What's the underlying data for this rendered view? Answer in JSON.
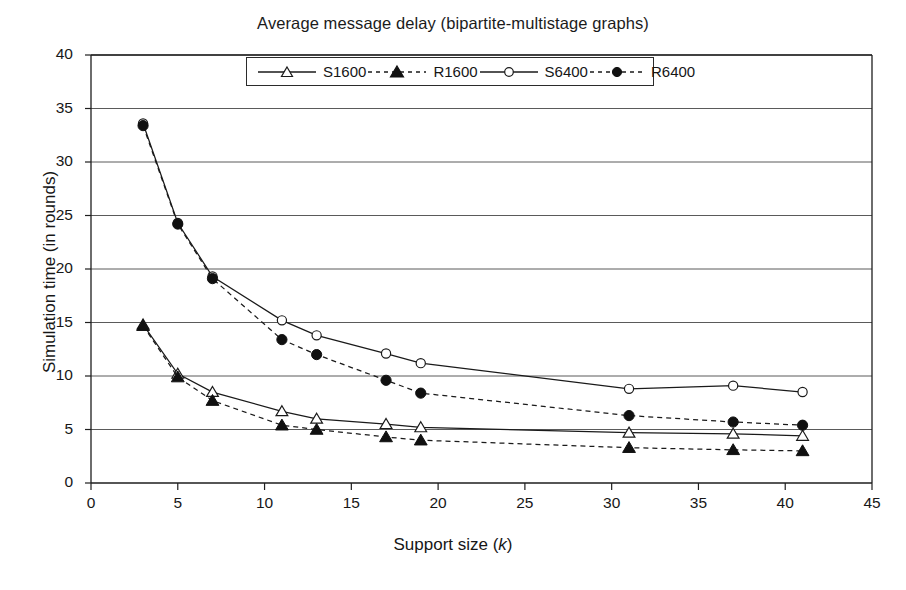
{
  "chart_data": {
    "type": "line",
    "title": "Average message delay (bipartite-multistage graphs)",
    "xlabel": "Support size (k)",
    "ylabel": "Simulation time (in rounds)",
    "xlim": [
      0,
      45
    ],
    "ylim": [
      0,
      40
    ],
    "xticks": [
      0,
      5,
      10,
      15,
      20,
      25,
      30,
      35,
      40,
      45
    ],
    "yticks": [
      0,
      5,
      10,
      15,
      20,
      25,
      30,
      35,
      40
    ],
    "grid": "horizontal",
    "legend_position": "top-center-inside",
    "series": [
      {
        "name": "S1600",
        "marker": "open-triangle",
        "line": "solid",
        "x": [
          3,
          5,
          7,
          11,
          13,
          17,
          19,
          31,
          37,
          41
        ],
        "values": [
          14.8,
          10.2,
          8.5,
          6.7,
          6.0,
          5.5,
          5.2,
          4.7,
          4.6,
          4.4
        ]
      },
      {
        "name": "R1600",
        "marker": "filled-triangle",
        "line": "dashed",
        "x": [
          3,
          5,
          7,
          11,
          13,
          17,
          19,
          31,
          37,
          41
        ],
        "values": [
          14.7,
          9.9,
          7.7,
          5.4,
          5.0,
          4.3,
          4.0,
          3.3,
          3.1,
          3.0
        ]
      },
      {
        "name": "S6400",
        "marker": "open-circle",
        "line": "solid",
        "x": [
          3,
          5,
          7,
          11,
          13,
          17,
          19,
          31,
          37,
          41
        ],
        "values": [
          33.6,
          24.3,
          19.3,
          15.2,
          13.8,
          12.1,
          11.2,
          8.8,
          9.1,
          8.5
        ]
      },
      {
        "name": "R6400",
        "marker": "filled-circle",
        "line": "dashed",
        "x": [
          3,
          5,
          7,
          11,
          13,
          17,
          19,
          31,
          37,
          41
        ],
        "values": [
          33.4,
          24.2,
          19.1,
          13.4,
          12.0,
          9.6,
          8.4,
          6.3,
          5.7,
          5.4
        ]
      }
    ]
  },
  "legend": {
    "items": [
      {
        "label": "S1600"
      },
      {
        "label": "R1600"
      },
      {
        "label": "S6400"
      },
      {
        "label": "R6400"
      }
    ]
  },
  "axis_titles": {
    "x_main": "Support size (",
    "x_italic": "k",
    "x_close": ")",
    "y": "Simulation time (in rounds)"
  }
}
